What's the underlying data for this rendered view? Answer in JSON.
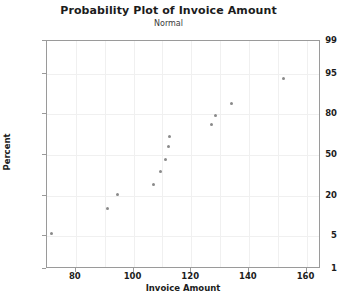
{
  "chart_data": {
    "type": "scatter",
    "title": "Probability Plot of Invoice Amount",
    "subtitle": "Normal",
    "xlabel": "Invoice Amount",
    "ylabel": "Percent",
    "xlim": [
      70,
      165
    ],
    "ylim": [
      1,
      99
    ],
    "yscale": "normal-probability",
    "grid": true,
    "legend": false,
    "xticks": [
      80,
      100,
      120,
      140,
      160
    ],
    "yticks": [
      1,
      5,
      20,
      50,
      80,
      95,
      99
    ],
    "marker_color": "#8a8a8a",
    "frame_color": "#9a9a9a",
    "grid_color": "#f0f0f0",
    "points": [
      {
        "x": 71.5,
        "y": 5.4
      },
      {
        "x": 91.0,
        "y": 13.6
      },
      {
        "x": 94.5,
        "y": 21.0
      },
      {
        "x": 107.0,
        "y": 27.5
      },
      {
        "x": 109.5,
        "y": 36.5
      },
      {
        "x": 111.0,
        "y": 46.0
      },
      {
        "x": 112.0,
        "y": 56.5
      },
      {
        "x": 112.5,
        "y": 65.0
      },
      {
        "x": 127.0,
        "y": 73.5
      },
      {
        "x": 128.5,
        "y": 79.0
      },
      {
        "x": 134.0,
        "y": 85.5
      },
      {
        "x": 152.0,
        "y": 94.0
      }
    ]
  }
}
